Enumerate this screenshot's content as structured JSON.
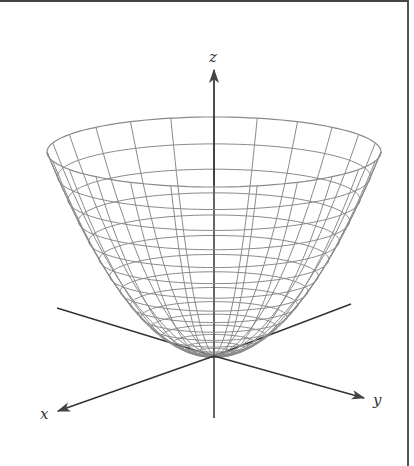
{
  "figure": {
    "surface": "paraboloid",
    "axes": {
      "x": {
        "label": "x"
      },
      "y": {
        "label": "y"
      },
      "z": {
        "label": "z"
      }
    },
    "colors": {
      "mesh": "#8a8a8a",
      "axis": "#333333",
      "frame": "#444444"
    },
    "mesh": {
      "rings": 16,
      "meridians": 24
    }
  }
}
